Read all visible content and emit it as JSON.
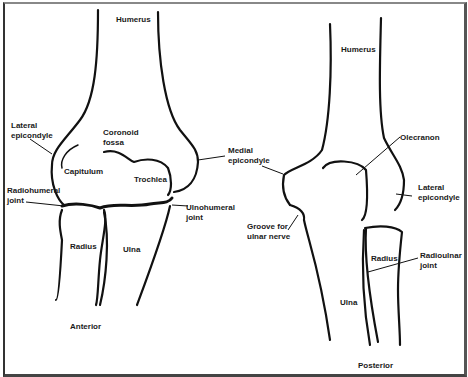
{
  "anterior_view": {
    "caption": "Anterior",
    "labels": {
      "humerus": "Humerus",
      "lateral_epicondyle": "Lateral\nepicondyle",
      "coronoid_fossa": "Coronoid\nfossa",
      "capitulum": "Capitulum",
      "trochlea": "Trochlea",
      "medial_epicondyle": "Medial\nepicondyle",
      "radiohumeral_joint": "Radiohumeral\njoint",
      "ulnohumeral_joint": "Ulnohumeral\njoint",
      "radius": "Radius",
      "ulna": "Ulna"
    }
  },
  "posterior_view": {
    "caption": "Posterior",
    "labels": {
      "humerus": "Humerus",
      "olecranon": "Olecranon",
      "lateral_epicondyle": "Lateral\nepicondyle",
      "groove_for_ulnar_nerve": "Groove for\nulnar nerve",
      "radius": "Radius",
      "radioulnar_joint": "Radioulnar\njoint",
      "ulna": "Ulna"
    }
  }
}
